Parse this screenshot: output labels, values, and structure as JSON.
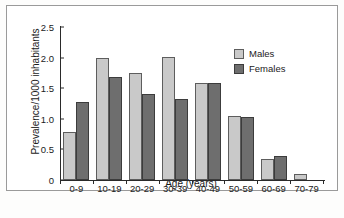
{
  "chart_data": {
    "type": "bar",
    "title": "",
    "subtitle": "",
    "categories": [
      "0-9",
      "10-19",
      "20-29",
      "30-39",
      "40-49",
      "50-59",
      "60-69",
      "70-79"
    ],
    "series": [
      {
        "name": "Males",
        "color": "#c9c9c9",
        "values": [
          0.78,
          1.99,
          1.75,
          2.01,
          1.59,
          1.05,
          0.35,
          0.1
        ]
      },
      {
        "name": "Females",
        "color": "#6e6e6e",
        "values": [
          1.27,
          1.68,
          1.41,
          1.32,
          1.58,
          1.03,
          0.4,
          0.0
        ]
      }
    ],
    "xlabel": "Age (years)",
    "ylabel": "Prevalence/1000 inhabitants",
    "ylim": [
      0,
      2.5
    ],
    "yticks": [
      "0",
      "0.5",
      "1.0",
      "1.5",
      "2.0",
      "2.5"
    ],
    "ytick_values": [
      0,
      0.5,
      1.0,
      1.5,
      2.0,
      2.5
    ],
    "grid": false,
    "legend_position": "top-right"
  },
  "legend": {
    "entries": [
      {
        "label": "Males"
      },
      {
        "label": "Females"
      }
    ]
  },
  "artifacts": {
    "ghost_top": "",
    "ghost_bottom": ""
  }
}
